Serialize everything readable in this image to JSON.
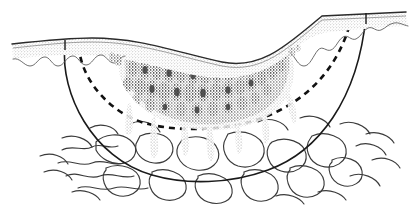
{
  "figure": {
    "title": "Skin cross-section with pigmented lesion and excision margins",
    "caption": "",
    "background_color": "#ffffff",
    "ink_color": "#1a1a1a",
    "stipple_color": "#8a8a8a",
    "lesion_color": "#4a4a4a",
    "width": 414,
    "height": 206
  },
  "layers": [
    {
      "id": "epidermis",
      "label": "Epidermis",
      "fill": "#dcdcdc",
      "stroke": "#2b2b2b",
      "description": "Stippled surface band with scalloped rete-ridge lower border"
    },
    {
      "id": "lesion",
      "label": "Pigmented lesion",
      "fill": "#555555",
      "description": "Dense nested cellular blobs beneath the epidermis"
    },
    {
      "id": "dermis",
      "label": "Dermis",
      "fill": "#ffffff",
      "description": "Clear zone between lesion and subcutis"
    },
    {
      "id": "subcutis",
      "label": "Subcutaneous tissue",
      "stroke": "#333333",
      "description": "Squiggly lobular adipose pattern at the base"
    }
  ],
  "margins": [
    {
      "id": "dashed-margin",
      "label": "Narrow excision margin",
      "style": "dashed",
      "stroke": "#111111",
      "stroke_width": 2.4,
      "dash_pattern": "6 5",
      "left_entry_x": 79,
      "right_entry_x": 352,
      "deepest_y": 127
    },
    {
      "id": "solid-margin",
      "label": "Wide excision margin",
      "style": "solid",
      "stroke": "#1a1a1a",
      "stroke_width": 1.6,
      "left_entry_x": 65,
      "right_entry_x": 366,
      "deepest_y": 179
    }
  ],
  "surface": {
    "id": "skin-surface",
    "label": "Skin surface contour",
    "left_x": 12,
    "left_y": 44,
    "crest_x": 92,
    "crest_y": 38,
    "trough_x": 222,
    "trough_y": 62,
    "shoulder_x": 322,
    "shoulder_y": 16,
    "right_x": 406,
    "right_y": 12
  },
  "annotations": []
}
